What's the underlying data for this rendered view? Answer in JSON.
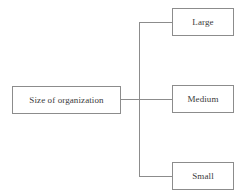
{
  "diagram": {
    "background_color": "#ffffff",
    "line_color": "#8c8c8c",
    "text_color": "#3a3a3a",
    "root": {
      "label": "Size of organization"
    },
    "branches": [
      {
        "label": "Large"
      },
      {
        "label": "Medium"
      },
      {
        "label": "Small"
      }
    ]
  }
}
